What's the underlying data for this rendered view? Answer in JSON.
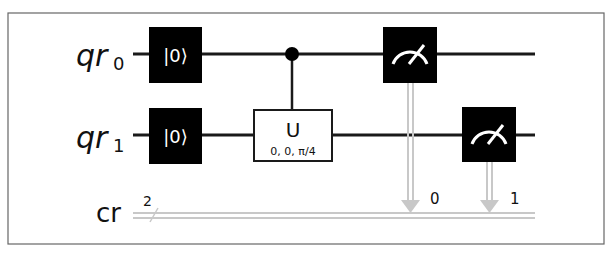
{
  "circuit": {
    "qubits": [
      {
        "name": "qr",
        "index": "0"
      },
      {
        "name": "qr",
        "index": "1"
      }
    ],
    "classical": {
      "name": "cr",
      "width_label": "2"
    },
    "gates": {
      "reset_label": "|0⟩",
      "u_gate": {
        "label": "U",
        "params": "0, 0, π/4",
        "control_qubit": 0,
        "target_qubit": 1
      },
      "measures": [
        {
          "qubit": 0,
          "clbit_label": "0"
        },
        {
          "qubit": 1,
          "clbit_label": "1"
        }
      ]
    },
    "colors": {
      "wire": "#1a1a1a",
      "classical_wire": "#c8c8c8",
      "gate_fill": "#000000",
      "frame": "#555555"
    }
  }
}
